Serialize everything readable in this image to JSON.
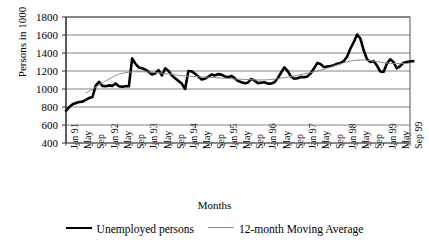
{
  "chart_data": {
    "type": "line",
    "title": "",
    "xlabel": "Months",
    "ylabel": "Persons in 1000",
    "ylim": [
      400,
      1800
    ],
    "yticks": [
      400,
      600,
      800,
      1000,
      1200,
      1400,
      1600,
      1800
    ],
    "grid": true,
    "legend_position": "bottom",
    "x_tick_labels": [
      "Jan 91",
      "May",
      "Sep",
      "Jan 92",
      "May",
      "Sep",
      "Jan 93",
      "May",
      "Sep",
      "Jan 94",
      "May",
      "Sep",
      "Jan 95",
      "May",
      "Sep",
      "Jan 96",
      "May",
      "Sep",
      "Jan 97",
      "May",
      "Sep",
      "Jan 98",
      "May",
      "Sep",
      "Jan 99",
      "May",
      "Sep 99"
    ],
    "x_tick_interval_months": 4,
    "x_start": "Jan 91",
    "x_end": "Sep 99",
    "x_count": 105,
    "series": [
      {
        "name": "Unemployed persons",
        "color": "#000000",
        "width": 2.6,
        "values": [
          760,
          800,
          830,
          845,
          855,
          860,
          880,
          900,
          910,
          1040,
          1080,
          1035,
          1030,
          1040,
          1035,
          1060,
          1030,
          1025,
          1030,
          1030,
          1340,
          1280,
          1240,
          1230,
          1215,
          1190,
          1160,
          1175,
          1210,
          1150,
          1230,
          1200,
          1150,
          1120,
          1090,
          1060,
          1000,
          1200,
          1195,
          1170,
          1140,
          1105,
          1115,
          1135,
          1160,
          1150,
          1165,
          1160,
          1140,
          1130,
          1145,
          1120,
          1090,
          1075,
          1065,
          1070,
          1110,
          1095,
          1065,
          1070,
          1075,
          1060,
          1060,
          1075,
          1120,
          1180,
          1240,
          1200,
          1140,
          1115,
          1120,
          1135,
          1130,
          1140,
          1175,
          1230,
          1290,
          1275,
          1245,
          1250,
          1255,
          1265,
          1280,
          1290,
          1310,
          1360,
          1450,
          1520,
          1605,
          1560,
          1430,
          1330,
          1300,
          1310,
          1260,
          1195,
          1190,
          1280,
          1330,
          1300,
          1230,
          1255,
          1290,
          1300,
          1305,
          1310
        ]
      },
      {
        "name": "12-month Moving Average",
        "color": "#8b8b8b",
        "width": 1,
        "start_index": 6,
        "values": [
          955,
          975,
          995,
          1020,
          1045,
          1070,
          1090,
          1110,
          1130,
          1150,
          1165,
          1175,
          1180,
          1185,
          1190,
          1192,
          1193,
          1192,
          1190,
          1188,
          1186,
          1184,
          1180,
          1176,
          1172,
          1168,
          1163,
          1158,
          1152,
          1148,
          1145,
          1142,
          1140,
          1138,
          1136,
          1134,
          1132,
          1130,
          1128,
          1126,
          1124,
          1122,
          1120,
          1118,
          1115,
          1112,
          1110,
          1108,
          1106,
          1104,
          1102,
          1101,
          1100,
          1100,
          1101,
          1103,
          1106,
          1110,
          1115,
          1120,
          1126,
          1132,
          1138,
          1145,
          1152,
          1160,
          1168,
          1176,
          1184,
          1192,
          1200,
          1210,
          1220,
          1232,
          1244,
          1256,
          1268,
          1280,
          1292,
          1302,
          1310,
          1316,
          1320,
          1322,
          1322,
          1320,
          1316,
          1310,
          1304,
          1298,
          1292,
          1288,
          1285,
          1283,
          1282,
          1282,
          1283,
          1285,
          1288
        ]
      }
    ]
  },
  "legend": {
    "item1": "Unemployed persons",
    "item2": "12-month Moving Average"
  },
  "axes": {
    "x_title": "Months",
    "y_title": "Persons in 1000"
  }
}
